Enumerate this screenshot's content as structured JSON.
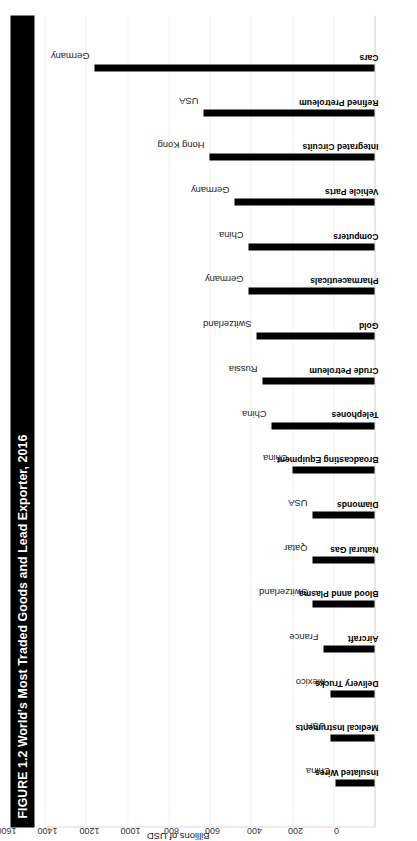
{
  "figure": {
    "title": "FIGURE 1.2 World's Most Traded Goods and Lead Exporter, 2016",
    "title_bg": "#000000",
    "title_fg": "#ffffff"
  },
  "axis": {
    "label": "Billions of USD",
    "ticks": [
      "0",
      "200",
      "400",
      "600",
      "800",
      "1000",
      "1200",
      "1400",
      "1600"
    ]
  },
  "chart_data": {
    "type": "bar",
    "title": "FIGURE 1.2 World's Most Traded Goods and Lead Exporter, 2016",
    "orientation": "vertical",
    "xlabel": "",
    "ylabel": "Billions of USD",
    "ylim": [
      0,
      1600
    ],
    "grid": true,
    "legend": "none",
    "categories": [
      "Insulated Wires",
      "Medical Instruments",
      "Delivery Trucks",
      "Aircraft",
      "Blood annd Plasma",
      "Natural Gas",
      "Diamonds",
      "Broadcasting Equipment",
      "Telephones",
      "Crude Petroleum",
      "Gold",
      "Pharmaceuticals",
      "Computers",
      "Vehicle Parts",
      "Integrated Circuits",
      "Refined Pretroleum",
      "Cars"
    ],
    "values": [
      190,
      215,
      215,
      245,
      300,
      300,
      300,
      400,
      500,
      545,
      570,
      610,
      610,
      680,
      800,
      830,
      1360
    ],
    "annotations": [
      "China",
      "USA",
      "Mexico",
      "France",
      "Switzerland",
      "Qatar",
      "USA",
      "China",
      "China",
      "Russia",
      "Switzerland",
      "Germany",
      "China",
      "Germany",
      "Hong Kong",
      "USA",
      "Germany"
    ],
    "annotation_label": "Lead Exporter"
  }
}
